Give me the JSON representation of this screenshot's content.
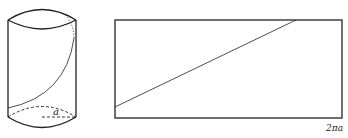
{
  "figure": {
    "cylinder": {
      "radius_label": "a"
    },
    "unrolled": {
      "width_label": "2πa"
    }
  }
}
